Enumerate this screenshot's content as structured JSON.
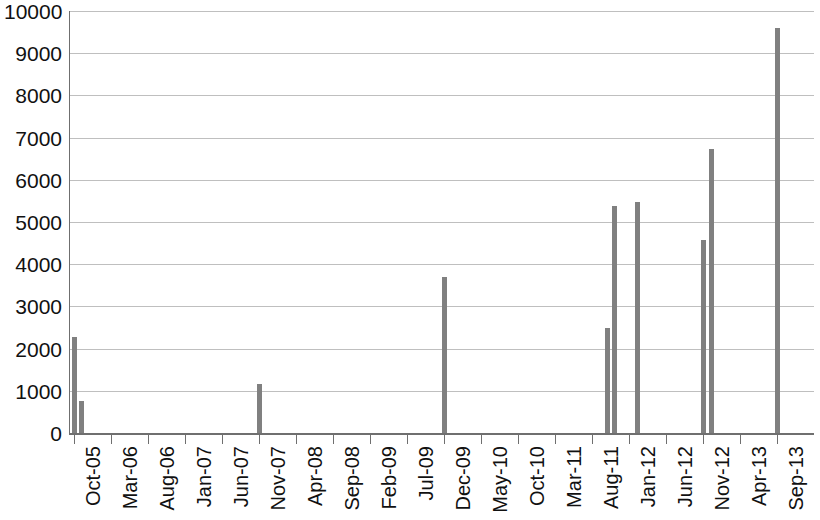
{
  "chart_data": {
    "type": "bar",
    "title": "",
    "subtitle": "",
    "xlabel": "",
    "ylabel": "",
    "ylim": [
      0,
      10000
    ],
    "ytick_interval": 1000,
    "ytick_labels": [
      "10000",
      "9000",
      "8000",
      "7000",
      "6000",
      "5000",
      "4000",
      "3000",
      "2000",
      "1000",
      "0"
    ],
    "ytick_values": [
      10000,
      9000,
      8000,
      7000,
      6000,
      5000,
      4000,
      3000,
      2000,
      1000,
      0
    ],
    "grid": true,
    "grid_axis": "y",
    "legend": false,
    "legend_position": "none",
    "bar_color": "#808080",
    "axis_color": "#6f6f6f",
    "gridline_color": "#bfbfbf",
    "text_color": "#111111",
    "x_axis_type": "monthly-category",
    "x_start": "Oct-05",
    "x_end": "Sep-13",
    "x_total_months": 96,
    "xtick_every_months": 5,
    "xtick_labels": [
      "Oct-05",
      "Mar-06",
      "Aug-06",
      "Jan-07",
      "Jun-07",
      "Nov-07",
      "Apr-08",
      "Sep-08",
      "Feb-09",
      "Jul-09",
      "Dec-09",
      "May-10",
      "Oct-10",
      "Mar-11",
      "Aug-11",
      "Jan-12",
      "Jun-12",
      "Nov-12",
      "Apr-13",
      "Sep-13"
    ],
    "categories": [
      "Oct-05",
      "Nov-05",
      "Nov-07",
      "Dec-09",
      "Oct-11",
      "Nov-11",
      "Feb-12",
      "Nov-12",
      "Dec-12",
      "Sep-13"
    ],
    "values": [
      2280,
      770,
      1150,
      3700,
      2500,
      5370,
      5480,
      4580,
      6730,
      9600
    ],
    "month_indices": [
      0,
      1,
      25,
      50,
      72,
      73,
      76,
      85,
      86,
      95
    ],
    "nonzero_points": [
      {
        "month": "Oct-05",
        "index": 0,
        "value": 2280
      },
      {
        "month": "Nov-05",
        "index": 1,
        "value": 770
      },
      {
        "month": "Nov-07",
        "index": 25,
        "value": 1150
      },
      {
        "month": "Dec-09",
        "index": 50,
        "value": 3700
      },
      {
        "month": "Oct-11",
        "index": 72,
        "value": 2500
      },
      {
        "month": "Nov-11",
        "index": 73,
        "value": 5370
      },
      {
        "month": "Feb-12",
        "index": 76,
        "value": 5480
      },
      {
        "month": "Nov-12",
        "index": 85,
        "value": 4580
      },
      {
        "month": "Dec-12",
        "index": 86,
        "value": 6730
      },
      {
        "month": "Sep-13",
        "index": 95,
        "value": 9600
      }
    ]
  }
}
